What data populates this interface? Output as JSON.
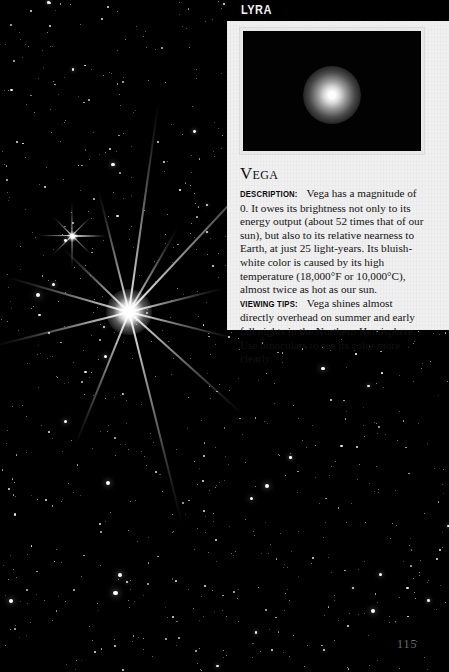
{
  "page": {
    "number": "115",
    "constellation_header": "LYRA"
  },
  "inset": {
    "caption_alt": "vega-star-photo"
  },
  "article": {
    "heading": "Vega",
    "description_label": "Description:",
    "description_text": " Vega has a magnitude of 0. It owes its brightness not only to its energy output (about 52 times that of our sun), but also to its relative nearness to Earth, at just 25 light-years. Its bluish-white color is caused by its high temperature (18,000°F or 10,000°C), almost twice as hot as our sun. ",
    "viewing_tips_label": "Viewing tips:",
    "viewing_tips_text": " Vega shines almost directly overhead on summer and early fall nights in the Northern Hemisphere. Use binoculars to see its color more clearly."
  },
  "colors": {
    "paper": "#f0f0f0",
    "ink": "#131313",
    "sky": "#000000",
    "star": "#ffffff",
    "page_number": "#6d6d6d"
  },
  "starfield": {
    "main_star": {
      "x": 129,
      "y": 312,
      "spikes": 8
    },
    "secondary_star": {
      "x": 72,
      "y": 236,
      "spikes": 8
    }
  }
}
